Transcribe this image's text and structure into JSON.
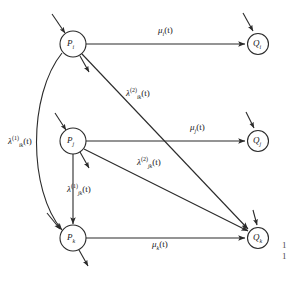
{
  "figure": {
    "type": "queueing-network-state-transition-diagram",
    "background": "#ffffff",
    "stroke_color": "#2b2b2b",
    "text_color": "#1a1a1a",
    "width": 293,
    "height": 282
  },
  "nodes": [
    {
      "id": "P_i",
      "base": "P",
      "subscript": "i",
      "cx": 73,
      "cy": 44,
      "r": 13,
      "column": "left"
    },
    {
      "id": "P_j",
      "base": "P",
      "subscript": "j",
      "cx": 73,
      "cy": 141,
      "r": 13,
      "column": "left"
    },
    {
      "id": "P_k",
      "base": "P",
      "subscript": "k",
      "cx": 73,
      "cy": 238,
      "r": 13,
      "column": "left"
    },
    {
      "id": "Q_i",
      "base": "Q",
      "subscript": "i",
      "cx": 258,
      "cy": 44,
      "r": 11,
      "column": "right"
    },
    {
      "id": "Q_j",
      "base": "Q",
      "subscript": "j",
      "cx": 258,
      "cy": 141,
      "r": 11,
      "column": "right"
    },
    {
      "id": "Q_k",
      "base": "Q",
      "subscript": "k",
      "cx": 258,
      "cy": 238,
      "r": 11,
      "column": "right"
    }
  ],
  "edges": [
    {
      "id": "mu_i",
      "from": "P_i",
      "to": "Q_i",
      "shape": "straight",
      "label_base": "μ",
      "label_sub": "i",
      "label_sup": "",
      "label_tail": "(t)"
    },
    {
      "id": "mu_j",
      "from": "P_j",
      "to": "Q_j",
      "shape": "straight",
      "label_base": "μ",
      "label_sub": "j",
      "label_sup": "",
      "label_tail": "(t)"
    },
    {
      "id": "mu_k",
      "from": "P_k",
      "to": "Q_k",
      "shape": "straight",
      "label_base": "μ",
      "label_sub": "k",
      "label_sup": "",
      "label_tail": "(t)"
    },
    {
      "id": "lambda_ik_2",
      "from": "P_i",
      "to": "Q_k",
      "shape": "straight",
      "label_base": "λ",
      "label_sub": "ik",
      "label_sup": "(2)",
      "label_tail": "(t)"
    },
    {
      "id": "lambda_jk_2",
      "from": "P_j",
      "to": "Q_k",
      "shape": "straight",
      "label_base": "λ",
      "label_sub": "jk",
      "label_sup": "(2)",
      "label_tail": "(t)"
    },
    {
      "id": "lambda_ik_1",
      "from": "P_i",
      "to": "P_k",
      "shape": "curved-left",
      "label_base": "λ",
      "label_sub": "ik",
      "label_sup": "(1)",
      "label_tail": "(t)"
    },
    {
      "id": "lambda_jk_1",
      "from": "P_j",
      "to": "P_k",
      "shape": "straight-vertical",
      "label_base": "λ",
      "label_sub": "jk",
      "label_sup": "(1)",
      "label_tail": "(t)"
    }
  ],
  "external_arrows": [
    {
      "id": "arrival-P_i",
      "kind": "in",
      "at": "P_i"
    },
    {
      "id": "departure-P_i",
      "kind": "out",
      "at": "P_i"
    },
    {
      "id": "arrival-P_j",
      "kind": "in",
      "at": "P_j"
    },
    {
      "id": "departure-P_j",
      "kind": "out",
      "at": "P_j"
    },
    {
      "id": "arrival-P_k",
      "kind": "in",
      "at": "P_k"
    },
    {
      "id": "departure-P_k",
      "kind": "out",
      "at": "P_k"
    },
    {
      "id": "arrival-Q_i",
      "kind": "in",
      "at": "Q_i"
    },
    {
      "id": "arrival-Q_j",
      "kind": "in",
      "at": "Q_j"
    }
  ],
  "labels": {
    "mu_i": {
      "base": "μ",
      "sub": "i",
      "sup": "",
      "tail": "(t)",
      "x": 158,
      "y": 26
    },
    "mu_j": {
      "base": "μ",
      "sub": "j",
      "sup": "",
      "tail": "(t)",
      "x": 190,
      "y": 123
    },
    "mu_k": {
      "base": "μ",
      "sub": "k",
      "sup": "",
      "tail": "(t)",
      "x": 152,
      "y": 240
    },
    "lambda_ik_2": {
      "base": "λ",
      "sub": "ik",
      "sup": "(2)",
      "tail": "(t)",
      "x": 126,
      "y": 87
    },
    "lambda_jk_2": {
      "base": "λ",
      "sub": "jk",
      "sup": "(2)",
      "tail": "(t)",
      "x": 137,
      "y": 156
    },
    "lambda_ik_1": {
      "base": "λ",
      "sub": "ik",
      "sup": "(1)",
      "tail": "(t)",
      "x": 8,
      "y": 135
    },
    "lambda_jk_1": {
      "base": "λ",
      "sub": "jk",
      "sup": "(1)",
      "tail": "(t)",
      "x": 67,
      "y": 183
    }
  },
  "caption": {
    "line1": "1",
    "line2": "1",
    "x": 282,
    "y": 240
  }
}
